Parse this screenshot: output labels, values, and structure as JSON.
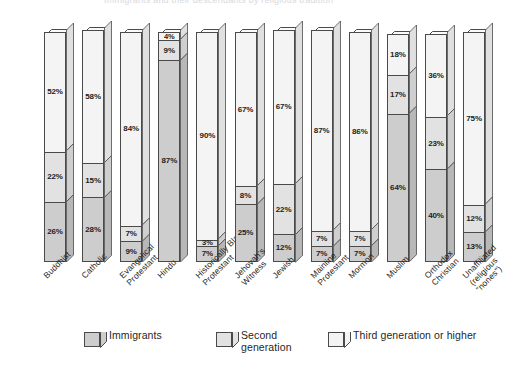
{
  "top_strip": {
    "cropped_text": "Immigrants and their descendants by religious tradition"
  },
  "legend": {
    "items": [
      {
        "name": "immigrants",
        "label": "Immigrants",
        "label2": "",
        "color": "#cdcdcd"
      },
      {
        "name": "second-generation",
        "label": "Second",
        "label2": "generation",
        "color": "#e2e2e2"
      },
      {
        "name": "third-generation",
        "label": "Third generation or higher",
        "label2": "",
        "color": "#f4f4f4"
      }
    ]
  },
  "chart_data": {
    "type": "bar",
    "subtype": "stacked-3d-column",
    "title": "",
    "xlabel": "",
    "ylabel": "",
    "ylim": [
      0,
      100
    ],
    "grid": false,
    "legend_position": "bottom",
    "value_suffix": "%",
    "categories": [
      "Buddhist",
      "Catholic",
      "Evangelical Protestant",
      "Hindu",
      "Historically Black Protestant",
      "Jehovah's Witness",
      "Jewish",
      "Mainline Protestant",
      "Mormon",
      "Muslim",
      "Orthodox Christian",
      "Unaffiliated (religious “nones”)"
    ],
    "category_lines": [
      [
        "Buddhist"
      ],
      [
        "Catholic"
      ],
      [
        "Evangelical",
        "Protestant"
      ],
      [
        "Hindu"
      ],
      [
        "Historically Black",
        "Protestant"
      ],
      [
        "Jehovah's",
        "Witness"
      ],
      [
        "Jewish"
      ],
      [
        "Mainline",
        "Protestant"
      ],
      [
        "Mormon"
      ],
      [
        "Muslim"
      ],
      [
        "Orthodox",
        "Christian"
      ],
      [
        "Unaffiliated",
        "(religious",
        "“nones”)"
      ]
    ],
    "series": [
      {
        "name": "Third generation or higher",
        "color": "#f4f4f4",
        "values": [
          52,
          58,
          84,
          4,
          90,
          67,
          67,
          87,
          86,
          18,
          36,
          75
        ]
      },
      {
        "name": "Second generation",
        "color": "#e2e2e2",
        "values": [
          22,
          15,
          7,
          9,
          3,
          8,
          22,
          7,
          7,
          17,
          23,
          12
        ]
      },
      {
        "name": "Immigrants",
        "color": "#cdcdcd",
        "values": [
          26,
          28,
          9,
          87,
          7,
          25,
          12,
          7,
          7,
          64,
          40,
          13
        ]
      }
    ],
    "bars": [
      {
        "category": "Buddhist",
        "third": 52,
        "second": 22,
        "immigrants": 26
      },
      {
        "category": "Catholic",
        "third": 58,
        "second": 15,
        "immigrants": 28
      },
      {
        "category": "Evangelical Protestant",
        "third": 84,
        "second": 7,
        "immigrants": 9
      },
      {
        "category": "Hindu",
        "third": 4,
        "second": 9,
        "immigrants": 87
      },
      {
        "category": "Historically Black Protestant",
        "third": 90,
        "second": 3,
        "immigrants": 7
      },
      {
        "category": "Jehovah's Witness",
        "third": 67,
        "second": 8,
        "immigrants": 25
      },
      {
        "category": "Jewish",
        "third": 67,
        "second": 22,
        "immigrants": 12
      },
      {
        "category": "Mainline Protestant",
        "third": 87,
        "second": 7,
        "immigrants": 7
      },
      {
        "category": "Mormon",
        "third": 86,
        "second": 7,
        "immigrants": 7
      },
      {
        "category": "Muslim",
        "third": 18,
        "second": 17,
        "immigrants": 64
      },
      {
        "category": "Orthodox Christian",
        "third": 36,
        "second": 23,
        "immigrants": 40
      },
      {
        "category": "Unaffiliated (religious “nones”)",
        "third": 75,
        "second": 12,
        "immigrants": 13
      }
    ],
    "labels": {
      "third": [
        "52%",
        "58%",
        "84%",
        "4%",
        "90%",
        "67%",
        "67%",
        "87%",
        "86%",
        "18%",
        "36%",
        "75%"
      ],
      "second": [
        "22%",
        "15%",
        "7%",
        "9%",
        "3%",
        "8%",
        "22%",
        "7%",
        "7%",
        "17%",
        "23%",
        "12%"
      ],
      "immigrants": [
        "26%",
        "28%",
        "9%",
        "87%",
        "7%",
        "25%",
        "12%",
        "7%",
        "7%",
        "64%",
        "40%",
        "13%"
      ]
    }
  }
}
